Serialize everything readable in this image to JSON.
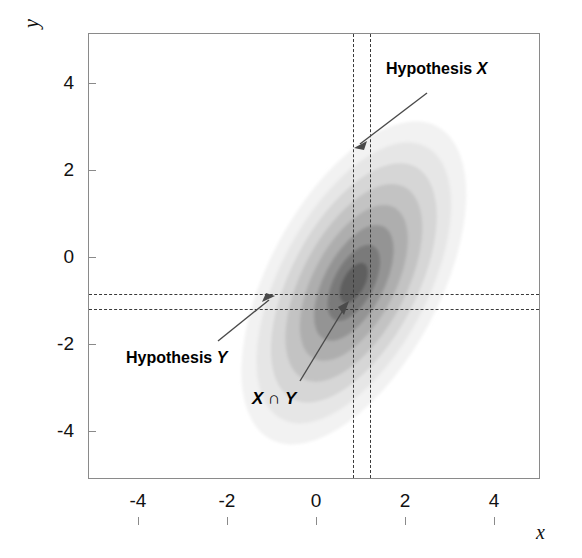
{
  "figure": {
    "background": "#ffffff",
    "frame_color": "#8a8a8a"
  },
  "axes": {
    "x_title": "x",
    "y_title": "y",
    "x_ticks": [
      "-4",
      "-2",
      "0",
      "2",
      "4"
    ],
    "y_ticks": [
      "4",
      "2",
      "0",
      "-2",
      "-4"
    ],
    "xlim": [
      -5.1,
      5.1
    ],
    "ylim": [
      -5.1,
      5.1
    ]
  },
  "annotations": {
    "hypothesis_x": {
      "prefix": "Hypothesis ",
      "symbol": "X"
    },
    "hypothesis_y": {
      "prefix": "Hypothesis ",
      "symbol": "Y"
    },
    "intersection": {
      "symbol_x": "X",
      "operator": " ∩ ",
      "symbol_y": "Y"
    }
  },
  "hypothesis_bands": {
    "x_band": {
      "low": 0.85,
      "high": 1.25,
      "style": "dashed",
      "color": "#3a3a3a"
    },
    "y_band": {
      "low": -1.2,
      "high": -0.85,
      "style": "dashed",
      "color": "#3a3a3a"
    }
  },
  "chart_data": {
    "type": "heatmap",
    "title": "",
    "xlabel": "x",
    "ylabel": "y",
    "xlim": [
      -5.1,
      5.1
    ],
    "ylim": [
      -5.1,
      5.1
    ],
    "grid": false,
    "legend": null,
    "distribution": {
      "kind": "bivariate-normal",
      "mean_x": 1.0,
      "mean_y": 0.2,
      "sigma_x": 1.05,
      "sigma_y": 1.75,
      "correlation": -0.78,
      "tilt_degrees": -62
    },
    "contour_levels": [
      {
        "level": 1,
        "relative_density": 0.08,
        "fill": "#f2f2f2"
      },
      {
        "level": 2,
        "relative_density": 0.2,
        "fill": "#e6e6e6"
      },
      {
        "level": 3,
        "relative_density": 0.33,
        "fill": "#d6d6d6"
      },
      {
        "level": 4,
        "relative_density": 0.46,
        "fill": "#c3c3c3"
      },
      {
        "level": 5,
        "relative_density": 0.6,
        "fill": "#aeaeae"
      },
      {
        "level": 6,
        "relative_density": 0.74,
        "fill": "#949494"
      },
      {
        "level": 7,
        "relative_density": 0.87,
        "fill": "#7a7a7a"
      },
      {
        "level": 8,
        "relative_density": 1.0,
        "fill": "#5e5e5e"
      }
    ],
    "x_tick_values": [
      -4,
      -2,
      0,
      2,
      4
    ],
    "y_tick_values": [
      -4,
      -2,
      0,
      2,
      4
    ],
    "x_tick_labels": [
      "-4",
      "-2",
      "0",
      "2",
      "4"
    ],
    "y_tick_labels": [
      "-4",
      "-2",
      "0",
      "2",
      "4"
    ],
    "marked_intervals": {
      "x": [
        0.85,
        1.25
      ],
      "y": [
        -1.2,
        -0.85
      ]
    }
  }
}
